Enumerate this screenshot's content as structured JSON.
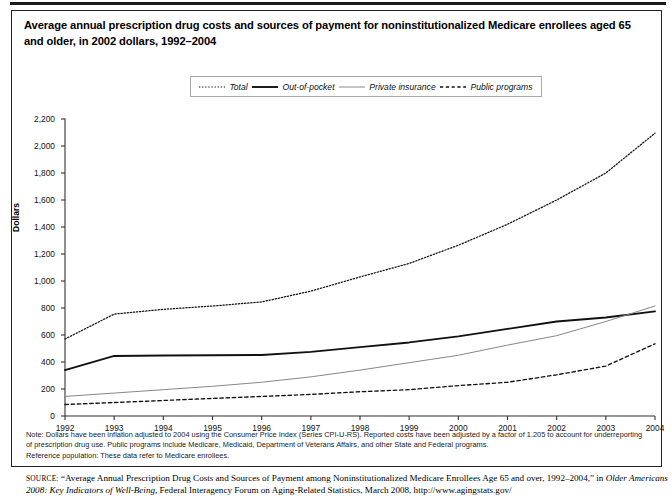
{
  "figure": {
    "title": "Average annual prescription drug costs and sources of payment for noninstitutionalized Medicare enrollees aged 65 and older, in 2002 dollars, 1992–2004",
    "notes_line1": "Note: Dollars have been inflation adjusted to 2004 using the Consumer Price Index (Series CPI-U-RS). Reported costs have been adjusted by a factor of 1.205 to account for underreporting of prescription drug use. Public programs include Medicare, Medicaid, Department of Veterans Affairs, and other State and Federal programs.",
    "notes_line2": "Reference population: These data refer to Medicare enrollees.",
    "source_label": "SOURCE:",
    "source_text": "“Average Annual Prescription Drug Costs and Sources of Payment among Noninstitutionalized Medicare Enrollees Age 65 and over, 1992–2004,”",
    "source_text2_a": "in ",
    "source_text2_italic": "Older Americans 2008: Key Indicators of Well-Being,",
    "source_text2_b": " Federal Interagency Forum on Aging-Related Statistics, March 2008, http://www.agingstats.gov/"
  },
  "chart_data": {
    "type": "line",
    "title": "Average annual prescription drug costs and sources of payment for noninstitutionalized Medicare enrollees aged 65 and older, in 2002 dollars, 1992–2004",
    "xlabel": "",
    "ylabel": "Dollars",
    "categories": [
      1992,
      1993,
      1994,
      1995,
      1996,
      1997,
      1998,
      1999,
      2000,
      2001,
      2002,
      2003,
      2004
    ],
    "xtick_labels": [
      "1992",
      "1993",
      "1994",
      "1995",
      "1996",
      "1997",
      "1998",
      "1999",
      "2000",
      "2001",
      "2002",
      "2003",
      "2004"
    ],
    "ytick_labels": [
      "0",
      "200",
      "400",
      "600",
      "800",
      "1,000",
      "1,200",
      "1,400",
      "1,600",
      "1,800",
      "2,000",
      "2,200"
    ],
    "ytick_values": [
      0,
      200,
      400,
      600,
      800,
      1000,
      1200,
      1400,
      1600,
      1800,
      2000,
      2200
    ],
    "ylim": [
      0,
      2200
    ],
    "grid": false,
    "legend_position": "top-center",
    "series": [
      {
        "name": "Total",
        "style": "dotted",
        "color": "#111111",
        "values": [
          570,
          755,
          790,
          815,
          845,
          925,
          1030,
          1130,
          1265,
          1420,
          1600,
          1800,
          2095
        ]
      },
      {
        "name": "Out-of-pocket",
        "style": "solid-thick",
        "color": "#111111",
        "values": [
          340,
          445,
          448,
          450,
          452,
          475,
          510,
          545,
          590,
          645,
          700,
          730,
          775
        ]
      },
      {
        "name": "Private insurance",
        "style": "solid-thin",
        "color": "#888888",
        "values": [
          145,
          170,
          195,
          220,
          250,
          290,
          340,
          395,
          450,
          525,
          595,
          700,
          815
        ]
      },
      {
        "name": "Public programs",
        "style": "dashed",
        "color": "#111111",
        "values": [
          85,
          100,
          115,
          130,
          145,
          160,
          180,
          195,
          225,
          250,
          305,
          370,
          535
        ]
      }
    ]
  }
}
